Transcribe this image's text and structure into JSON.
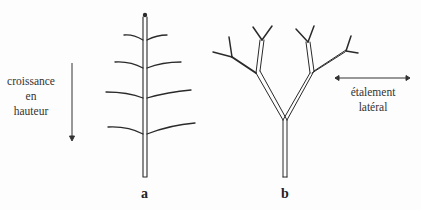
{
  "diagram": {
    "left_label": {
      "line1": "croissance",
      "line2": "en",
      "line3": "hauteur"
    },
    "right_label": {
      "line1": "étalement",
      "line2": "latéral"
    },
    "figure_a_label": "a",
    "figure_b_label": "b",
    "colors": {
      "stroke": "#2a2a2a",
      "background": "#fdfdfd"
    }
  }
}
